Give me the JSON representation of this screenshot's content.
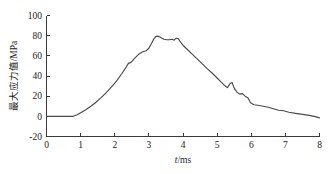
{
  "chart_data": {
    "type": "line",
    "title": "",
    "xlabel": "t/ms",
    "xlabel_italic_part": "t",
    "xlabel_rest": "/ms",
    "ylabel": "最大应力值/MPa",
    "xlim": [
      0,
      8
    ],
    "ylim": [
      -20,
      100
    ],
    "xticks": [
      0,
      1,
      2,
      3,
      4,
      5,
      6,
      7,
      8
    ],
    "xtick_labels": [
      "0",
      "1",
      "2",
      "3",
      "4",
      "5",
      "6",
      "7",
      "8"
    ],
    "yticks": [
      -20,
      0,
      20,
      40,
      60,
      80,
      100
    ],
    "ytick_labels": [
      "-20",
      "0",
      "20",
      "40",
      "60",
      "80",
      "100"
    ],
    "grid": false,
    "legend": null,
    "line_color": "#4a4a4a",
    "axis_color": "#3a3a3a",
    "background_color": "#ffffff",
    "series": [
      {
        "name": "最大应力值",
        "x": [
          0.0,
          0.2,
          0.4,
          0.6,
          0.78,
          0.9,
          1.0,
          1.15,
          1.3,
          1.45,
          1.6,
          1.75,
          1.9,
          2.05,
          2.2,
          2.32,
          2.4,
          2.48,
          2.58,
          2.7,
          2.82,
          2.92,
          3.0,
          3.08,
          3.14,
          3.2,
          3.28,
          3.36,
          3.44,
          3.52,
          3.6,
          3.68,
          3.74,
          3.8,
          3.86,
          3.92,
          4.0,
          4.12,
          4.26,
          4.4,
          4.55,
          4.7,
          4.85,
          5.0,
          5.12,
          5.22,
          5.3,
          5.38,
          5.44,
          5.5,
          5.58,
          5.66,
          5.74,
          5.82,
          5.9,
          5.98,
          6.08,
          6.2,
          6.35,
          6.5,
          6.65,
          6.8,
          6.95,
          7.1,
          7.3,
          7.5,
          7.7,
          7.85,
          8.0
        ],
        "y": [
          0.0,
          0.0,
          0.0,
          0.0,
          0.0,
          1.5,
          3.5,
          6.5,
          10.0,
          14.0,
          18.5,
          23.5,
          29.0,
          35.0,
          42.0,
          48.0,
          52.5,
          53.5,
          57.5,
          61.5,
          64.0,
          65.0,
          67.5,
          72.5,
          76.5,
          79.0,
          79.5,
          78.0,
          76.5,
          76.0,
          76.0,
          76.5,
          75.5,
          77.5,
          77.0,
          74.0,
          70.5,
          66.5,
          62.0,
          57.5,
          52.5,
          47.5,
          43.0,
          38.0,
          34.0,
          30.5,
          28.5,
          32.5,
          33.5,
          28.0,
          24.0,
          22.0,
          22.5,
          20.0,
          18.5,
          13.5,
          11.5,
          11.0,
          10.0,
          9.0,
          7.5,
          6.0,
          5.5,
          4.0,
          3.0,
          2.0,
          1.0,
          0.0,
          -1.5
        ]
      }
    ],
    "annotations": {
      "peak_value": 79.5,
      "peak_time": 3.2,
      "onset_time": 0.78,
      "secondary_bump_time": 5.44,
      "secondary_bump_value": 33.5,
      "end_value": -1.5
    }
  }
}
